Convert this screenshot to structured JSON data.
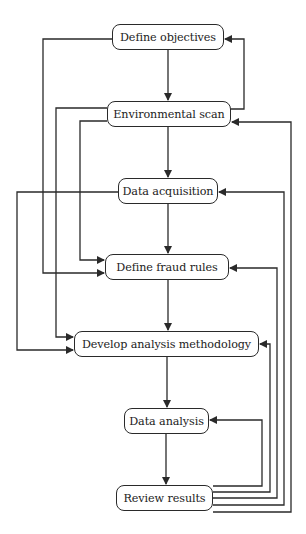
{
  "diagram": {
    "type": "flowchart",
    "line_color": "#2a2a2a",
    "nodes": [
      {
        "id": "n1",
        "label": "Define objectives",
        "x": 112,
        "y": 24,
        "w": 112,
        "h": 26
      },
      {
        "id": "n2",
        "label": "Environmental scan",
        "x": 107,
        "y": 101,
        "w": 124,
        "h": 26
      },
      {
        "id": "n3",
        "label": "Data acquisition",
        "x": 118,
        "y": 178,
        "w": 100,
        "h": 26
      },
      {
        "id": "n4",
        "label": "Define fraud rules",
        "x": 105,
        "y": 254,
        "w": 124,
        "h": 26
      },
      {
        "id": "n5",
        "label": "Develop analysis methodology",
        "x": 74,
        "y": 331,
        "w": 185,
        "h": 26
      },
      {
        "id": "n6",
        "label": "Data analysis",
        "x": 124,
        "y": 408,
        "w": 85,
        "h": 26
      },
      {
        "id": "n7",
        "label": "Review results",
        "x": 116,
        "y": 485,
        "w": 97,
        "h": 26
      }
    ],
    "edges": [
      {
        "from": "Define objectives",
        "to": "Environmental scan",
        "points": [
          [
            168,
            50
          ],
          [
            168,
            100
          ]
        ]
      },
      {
        "from": "Environmental scan",
        "to": "Data acquisition",
        "points": [
          [
            168,
            127
          ],
          [
            168,
            177
          ]
        ]
      },
      {
        "from": "Data acquisition",
        "to": "Define fraud rules",
        "points": [
          [
            168,
            204
          ],
          [
            168,
            253
          ]
        ]
      },
      {
        "from": "Define fraud rules",
        "to": "Develop analysis methodology",
        "points": [
          [
            168,
            280
          ],
          [
            168,
            330
          ]
        ]
      },
      {
        "from": "Develop analysis methodology",
        "to": "Data analysis",
        "points": [
          [
            167,
            357
          ],
          [
            167,
            407
          ]
        ]
      },
      {
        "from": "Data analysis",
        "to": "Review results",
        "points": [
          [
            166,
            434
          ],
          [
            166,
            484
          ]
        ]
      },
      {
        "from": "Environmental scan",
        "to": "Define objectives",
        "points": [
          [
            231,
            109
          ],
          [
            244,
            109
          ],
          [
            244,
            39
          ],
          [
            225,
            39
          ]
        ]
      },
      {
        "from": "Define objectives",
        "to": "Define fraud rules",
        "points": [
          [
            112,
            39
          ],
          [
            43,
            39
          ],
          [
            43,
            273
          ],
          [
            104,
            273
          ]
        ]
      },
      {
        "from": "Environmental scan",
        "to": "Develop analysis methodology",
        "points": [
          [
            107,
            108
          ],
          [
            56,
            108
          ],
          [
            56,
            337
          ],
          [
            73,
            337
          ]
        ]
      },
      {
        "from": "Environmental scan",
        "to": "Define fraud rules",
        "points": [
          [
            107,
            121
          ],
          [
            80,
            121
          ],
          [
            80,
            260
          ],
          [
            104,
            260
          ]
        ]
      },
      {
        "from": "Data acquisition",
        "to": "Develop analysis methodology",
        "points": [
          [
            118,
            192
          ],
          [
            17,
            192
          ],
          [
            17,
            350
          ],
          [
            73,
            350
          ]
        ]
      },
      {
        "from": "Review results",
        "to": "Data analysis",
        "points": [
          [
            213,
            486
          ],
          [
            262,
            486
          ],
          [
            262,
            420
          ],
          [
            210,
            420
          ]
        ]
      },
      {
        "from": "Review results",
        "to": "Develop analysis methodology",
        "points": [
          [
            213,
            492
          ],
          [
            270,
            492
          ],
          [
            270,
            344
          ],
          [
            260,
            344
          ]
        ]
      },
      {
        "from": "Review results",
        "to": "Define fraud rules",
        "points": [
          [
            213,
            498
          ],
          [
            277,
            498
          ],
          [
            277,
            268
          ],
          [
            230,
            268
          ]
        ]
      },
      {
        "from": "Review results",
        "to": "Data acquisition",
        "points": [
          [
            213,
            505
          ],
          [
            284,
            505
          ],
          [
            284,
            192
          ],
          [
            219,
            192
          ]
        ]
      },
      {
        "from": "Review results",
        "to": "Environmental scan",
        "points": [
          [
            213,
            512
          ],
          [
            291,
            512
          ],
          [
            291,
            122
          ],
          [
            232,
            122
          ]
        ]
      }
    ]
  }
}
